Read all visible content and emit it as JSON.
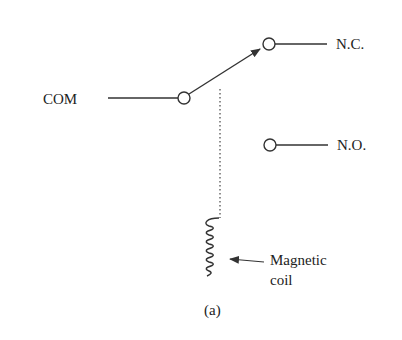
{
  "diagram": {
    "labels": {
      "com": "COM",
      "nc": "N.C.",
      "no": "N.O.",
      "coil_line1": "Magnetic",
      "coil_line2": "coil",
      "caption": "(a)"
    },
    "colors": {
      "stroke": "#333333",
      "text": "#222222"
    }
  }
}
